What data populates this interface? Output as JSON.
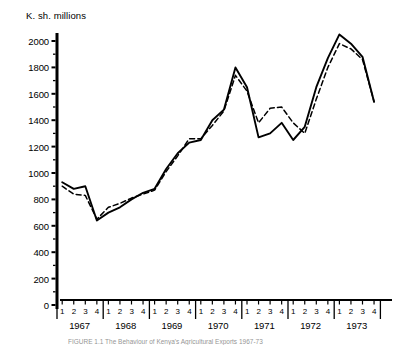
{
  "chart_data": {
    "type": "line",
    "title": "K. sh. millions",
    "xlabel": "",
    "ylabel": "K. sh. millions",
    "ylim": [
      0,
      2100
    ],
    "yticks": [
      0,
      200,
      400,
      600,
      800,
      1000,
      1200,
      1400,
      1600,
      1800,
      2000
    ],
    "grid": false,
    "legend_position": "none",
    "years": [
      "1967",
      "1968",
      "1969",
      "1970",
      "1971",
      "1972",
      "1973"
    ],
    "quarters": [
      "1",
      "2",
      "3",
      "4"
    ],
    "x": [
      "1967 1",
      "1967 2",
      "1967 3",
      "1967 4",
      "1968 1",
      "1968 2",
      "1968 3",
      "1968 4",
      "1969 1",
      "1969 2",
      "1969 3",
      "1969 4",
      "1970 1",
      "1970 2",
      "1970 3",
      "1970 4",
      "1971 1",
      "1971 2",
      "1971 3",
      "1971 4",
      "1972 1",
      "1972 2",
      "1972 3",
      "1972 4",
      "1973 1",
      "1973 2",
      "1973 3",
      "1973 4"
    ],
    "series": [
      {
        "name": "solid-series",
        "style": "solid",
        "values": [
          930,
          880,
          900,
          640,
          700,
          740,
          800,
          850,
          880,
          1030,
          1150,
          1230,
          1250,
          1400,
          1480,
          1800,
          1650,
          1270,
          1300,
          1380,
          1250,
          1350,
          1650,
          1870,
          2050,
          1980,
          1880,
          1540
        ]
      },
      {
        "name": "dashed-series",
        "style": "dashed",
        "values": [
          900,
          840,
          830,
          650,
          740,
          770,
          810,
          840,
          870,
          1010,
          1130,
          1260,
          1260,
          1360,
          1470,
          1740,
          1620,
          1380,
          1490,
          1500,
          1380,
          1300,
          1560,
          1800,
          1980,
          1940,
          1860,
          1540
        ]
      }
    ]
  },
  "caption": {
    "text": "FIGURE 1.1  The Behaviour of Kenya's Agricultural Exports 1967-73"
  }
}
